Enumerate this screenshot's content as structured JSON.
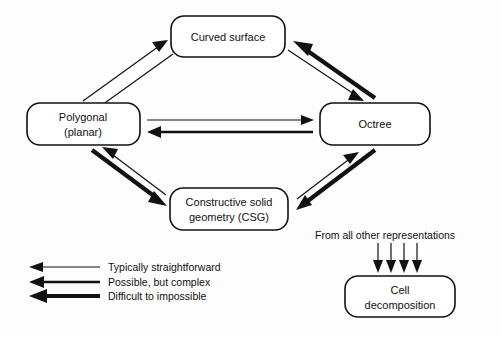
{
  "diagram": {
    "background_color": "#fdfdfd",
    "line_color": "#111111",
    "nodes": [
      {
        "id": "curved",
        "label": "Curved surface",
        "lines": [
          "Curved surface"
        ],
        "x": 171,
        "y": 16,
        "w": 114,
        "h": 41
      },
      {
        "id": "polygonal",
        "label": "Polygonal (planar)",
        "lines": [
          "Polygonal",
          "(planar)"
        ],
        "x": 27,
        "y": 103,
        "w": 113,
        "h": 42
      },
      {
        "id": "octree",
        "label": "Octree",
        "lines": [
          "Octree"
        ],
        "x": 320,
        "y": 103,
        "w": 110,
        "h": 42
      },
      {
        "id": "csg",
        "label": "Constructive solid geometry (CSG)",
        "lines": [
          "Constructive solid",
          "geometry (CSG)"
        ],
        "x": 170,
        "y": 188,
        "w": 118,
        "h": 42
      },
      {
        "id": "cell",
        "label": "Cell decomposition",
        "lines": [
          "Cell",
          "decomposition"
        ],
        "x": 345,
        "y": 276,
        "w": 110,
        "h": 41
      }
    ],
    "edges": [
      {
        "from": "polygonal",
        "to": "curved",
        "weight": "typically-straightforward"
      },
      {
        "from": "curved",
        "to": "polygonal",
        "weight": "typically-straightforward"
      },
      {
        "from": "curved",
        "to": "octree",
        "weight": "typically-straightforward"
      },
      {
        "from": "octree",
        "to": "curved",
        "weight": "difficult-to-impossible"
      },
      {
        "from": "polygonal",
        "to": "octree",
        "weight": "typically-straightforward"
      },
      {
        "from": "octree",
        "to": "polygonal",
        "weight": "possible-but-complex"
      },
      {
        "from": "polygonal",
        "to": "csg",
        "weight": "difficult-to-impossible"
      },
      {
        "from": "csg",
        "to": "polygonal",
        "weight": "typically-straightforward"
      },
      {
        "from": "csg",
        "to": "octree",
        "weight": "typically-straightforward"
      },
      {
        "from": "octree",
        "to": "csg",
        "weight": "difficult-to-impossible"
      }
    ],
    "annotation": {
      "text": "From all other representations",
      "arrow_count": 4,
      "target": "cell"
    },
    "legend": [
      {
        "key": "typically-straightforward",
        "label": "Typically straightforward",
        "weight": "thin"
      },
      {
        "key": "possible-but-complex",
        "label": "Possible, but complex",
        "weight": "medium"
      },
      {
        "key": "difficult-to-impossible",
        "label": "Difficult to impossible",
        "weight": "thick"
      }
    ]
  }
}
